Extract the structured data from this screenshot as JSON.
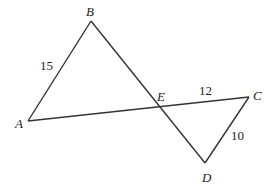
{
  "points": {
    "A": {
      "label": "A",
      "x": 28,
      "y": 121
    },
    "B": {
      "label": "B",
      "x": 91,
      "y": 21
    },
    "C": {
      "label": "C",
      "x": 249,
      "y": 97
    },
    "D": {
      "label": "D",
      "x": 205,
      "y": 163
    },
    "E": {
      "label": "E",
      "x": 160,
      "y": 106
    }
  },
  "segments": [
    {
      "from": "A",
      "to": "B"
    },
    {
      "from": "B",
      "to": "D"
    },
    {
      "from": "A",
      "to": "C"
    },
    {
      "from": "C",
      "to": "D"
    }
  ],
  "measures": {
    "AB": "15",
    "EC": "12",
    "CD": "10"
  }
}
